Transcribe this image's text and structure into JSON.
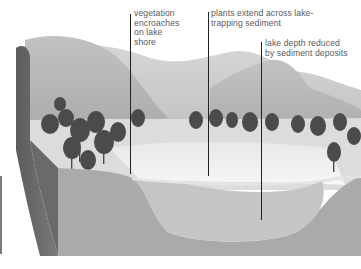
{
  "figure": {
    "labels": [
      {
        "id": "vegetation",
        "text": "vegetation\nencroaches\non lake\nshore"
      },
      {
        "id": "plants",
        "text": "plants extend across lake-\ntrapping sediment"
      },
      {
        "id": "depth",
        "text": "lake depth reduced\nby sediment deposits"
      }
    ]
  },
  "colors": {
    "sky": "#ffffff",
    "hills_far": "#c9c9c9",
    "hills_near": "#b4b4b4",
    "trees": "#4a4a4a",
    "meadow": "#e2e2e2",
    "lake_surface": "#f1f1f1",
    "sediment": "#c4c4c4",
    "ground_section": "#a9a9a9",
    "cliff_side": "#6e6e6e",
    "leader_line": "#222222"
  }
}
